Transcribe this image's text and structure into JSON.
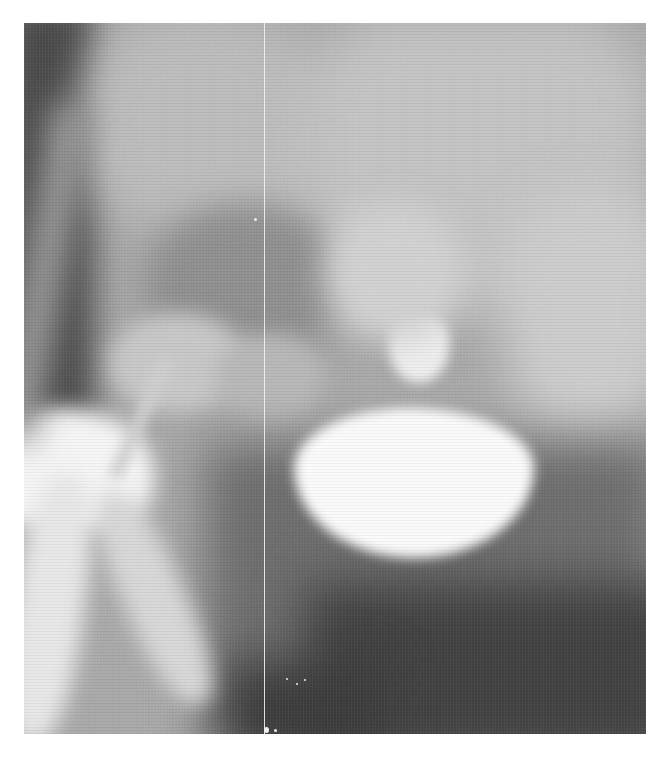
{
  "image": {
    "kind": "radiograph",
    "description": "Grayscale pelvic X-ray with contrast-filled bladder and urethra",
    "colors": {
      "background": "#ffffff",
      "soft_tissue_mid": "#a9a9a9",
      "soft_tissue_dark": "#4a4a4a",
      "air_dark": "#3c3c3c",
      "bone_light": "#cfcfcf",
      "contrast_bright": "#fbfbfb"
    },
    "frame": {
      "left": 24,
      "top": 23,
      "width": 622,
      "height": 711
    },
    "artifacts": {
      "vertical_line_x": 264
    }
  }
}
